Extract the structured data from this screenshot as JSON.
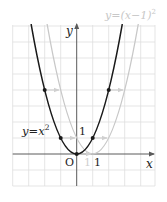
{
  "figure": {
    "colors": {
      "grid": "#dcdcdc",
      "axis": "#5a5a5a",
      "base_curve": "#1a1a1a",
      "shifted_curve": "#c8c8c8",
      "shift_arrow": "#d0d0d0",
      "shifted_label": "#c8c8c8"
    },
    "axes": {
      "x_label": "x",
      "y_label": "y",
      "origin_label": "O",
      "x_tick_label": "1",
      "x_tick_label_shifted": "1",
      "y_tick_label": "1"
    },
    "curves": [
      {
        "name": "base",
        "label_lhs": "y=x",
        "label_exp": "2",
        "equation": "y=x^2"
      },
      {
        "name": "shifted",
        "label_lhs": "y=(x−1)",
        "label_exp": "2",
        "equation": "y=(x-1)^2"
      }
    ],
    "marked_points": [
      {
        "x": -2,
        "y": 4
      },
      {
        "x": -1,
        "y": 1
      },
      {
        "x": 0,
        "y": 0
      },
      {
        "x": 1,
        "y": 1
      },
      {
        "x": 2,
        "y": 4
      }
    ],
    "shift": {
      "dx": 1,
      "dy": 0
    }
  }
}
